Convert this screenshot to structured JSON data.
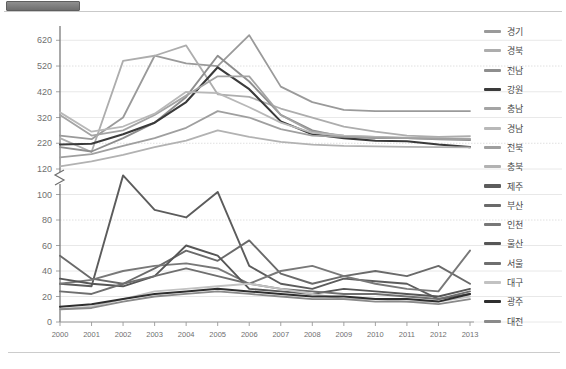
{
  "window": {
    "tab_name": "",
    "divider": "horizontal-rule"
  },
  "chart_data": {
    "type": "line",
    "title": "",
    "subtitle": "",
    "xlabel": "",
    "ylabel": "",
    "grid": true,
    "legend_position": "right",
    "broken_axis": true,
    "break_between": [
      120,
      220
    ],
    "x": [
      2000,
      2001,
      2002,
      2003,
      2004,
      2005,
      2006,
      2007,
      2008,
      2009,
      2010,
      2011,
      2012,
      2013
    ],
    "xtick_labels": [
      "2000",
      "2001",
      "2002",
      "2003",
      "2004",
      "2005",
      "2006",
      "2007",
      "2008",
      "2009",
      "2010",
      "2011",
      "2012",
      "2013"
    ],
    "ytick_labels": [
      "0",
      "20",
      "40",
      "60",
      "80",
      "100",
      "120",
      "220",
      "320",
      "420",
      "520",
      "620"
    ],
    "ytick_values": [
      0,
      20,
      40,
      60,
      80,
      100,
      120,
      220,
      320,
      420,
      520,
      620
    ],
    "ylim_lower": [
      0,
      120
    ],
    "ylim_upper": [
      120,
      660
    ],
    "series": [
      {
        "name": "경기",
        "color": "#9a9a9a",
        "width": 1.8,
        "values": [
          250,
          236,
          320,
          560,
          530,
          520,
          640,
          440,
          380,
          350,
          345,
          345,
          345,
          345
        ]
      },
      {
        "name": "경북",
        "color": "#adadad",
        "width": 1.8,
        "values": [
          240,
          186,
          540,
          560,
          600,
          410,
          400,
          355,
          320,
          285,
          265,
          250,
          245,
          248
        ]
      },
      {
        "name": "전남",
        "color": "#8e8e8e",
        "width": 1.9,
        "values": [
          205,
          188,
          240,
          300,
          400,
          560,
          460,
          330,
          270,
          245,
          240,
          240,
          235,
          232
        ]
      },
      {
        "name": "강원",
        "color": "#3a3a3a",
        "width": 2.1,
        "values": [
          215,
          218,
          255,
          300,
          380,
          515,
          430,
          305,
          255,
          240,
          230,
          228,
          215,
          205
        ]
      },
      {
        "name": "충남",
        "color": "#a4a4a4",
        "width": 1.8,
        "values": [
          330,
          250,
          270,
          330,
          405,
          480,
          480,
          330,
          265,
          250,
          245,
          240,
          238,
          236
        ]
      },
      {
        "name": "경남",
        "color": "#b8b8b8",
        "width": 1.8,
        "values": [
          340,
          265,
          285,
          335,
          420,
          415,
          360,
          300,
          260,
          250,
          245,
          242,
          240,
          238
        ]
      },
      {
        "name": "전북",
        "color": "#9f9f9f",
        "width": 1.8,
        "values": [
          165,
          178,
          210,
          240,
          280,
          345,
          320,
          275,
          250,
          245,
          242,
          240,
          238,
          236
        ]
      },
      {
        "name": "충북",
        "color": "#b2b2b2",
        "width": 1.8,
        "values": [
          130,
          150,
          175,
          205,
          230,
          270,
          245,
          225,
          215,
          210,
          208,
          206,
          205,
          204
        ]
      },
      {
        "name": "제주",
        "color": "#5c5c5c",
        "width": 1.9,
        "values": [
          30,
          28,
          115,
          88,
          82,
          102,
          44,
          30,
          26,
          34,
          32,
          30,
          18,
          22
        ]
      },
      {
        "name": "부산",
        "color": "#6a6a6a",
        "width": 1.9,
        "values": [
          52,
          34,
          30,
          42,
          56,
          48,
          64,
          38,
          30,
          36,
          40,
          36,
          44,
          30
        ]
      },
      {
        "name": "인천",
        "color": "#787878",
        "width": 1.9,
        "values": [
          30,
          33,
          40,
          44,
          46,
          42,
          30,
          40,
          44,
          36,
          30,
          26,
          24,
          56
        ]
      },
      {
        "name": "울산",
        "color": "#565656",
        "width": 1.9,
        "values": [
          34,
          30,
          28,
          36,
          60,
          52,
          26,
          24,
          22,
          26,
          24,
          22,
          20,
          26
        ]
      },
      {
        "name": "서울",
        "color": "#6f6f6f",
        "width": 1.9,
        "values": [
          24,
          22,
          30,
          36,
          42,
          36,
          30,
          26,
          24,
          22,
          22,
          20,
          18,
          24
        ]
      },
      {
        "name": "대구",
        "color": "#c2c2c2",
        "width": 1.9,
        "values": [
          10,
          12,
          18,
          24,
          26,
          28,
          30,
          26,
          22,
          18,
          18,
          16,
          16,
          20
        ]
      },
      {
        "name": "광주",
        "color": "#2e2e2e",
        "width": 2.0,
        "values": [
          12,
          14,
          18,
          22,
          24,
          26,
          24,
          22,
          20,
          20,
          18,
          18,
          16,
          22
        ]
      },
      {
        "name": "대전",
        "color": "#8a8a8a",
        "width": 1.8,
        "values": [
          10,
          11,
          16,
          20,
          22,
          24,
          22,
          20,
          18,
          18,
          16,
          16,
          14,
          18
        ]
      }
    ]
  }
}
